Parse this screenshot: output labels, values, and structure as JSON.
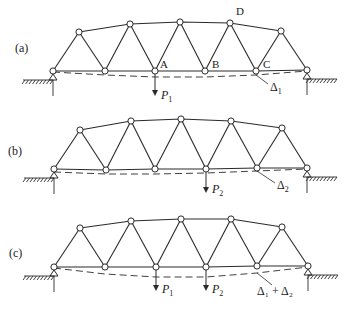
{
  "figure": {
    "panels": [
      {
        "id": "a",
        "label": "(a)",
        "label_pos": [
          15,
          52
        ],
        "bottom_nodes": [
          [
            53,
            71
          ],
          [
            105,
            71
          ],
          [
            155,
            71
          ],
          [
            205,
            71
          ],
          [
            256,
            71
          ],
          [
            307,
            70
          ]
        ],
        "top_nodes": [
          [
            79,
            32
          ],
          [
            130,
            24
          ],
          [
            180,
            22
          ],
          [
            230,
            23
          ],
          [
            281,
            31
          ]
        ],
        "node_labels": [
          {
            "text": "A",
            "x": 160,
            "y": 68
          },
          {
            "text": "B",
            "x": 212,
            "y": 68
          },
          {
            "text": "C",
            "x": 263,
            "y": 68
          },
          {
            "text": "D",
            "x": 236,
            "y": 15
          }
        ],
        "deflected_curve": [
          [
            53,
            72
          ],
          [
            105,
            75
          ],
          [
            155,
            77
          ],
          [
            205,
            77
          ],
          [
            256,
            75
          ],
          [
            307,
            71
          ]
        ],
        "loads": [
          {
            "node_x": 155,
            "node_y": 71,
            "tip_y": 96,
            "label": "P",
            "sub": "1",
            "lx": 161,
            "ly": 99
          }
        ],
        "deflection": {
          "from": [
            256,
            75
          ],
          "to": [
            268,
            84
          ],
          "label": "Δ",
          "sub": "1",
          "lx": 270,
          "ly": 91
        }
      },
      {
        "id": "b",
        "label": "(b)",
        "label_pos": [
          8,
          155
        ],
        "bottom_nodes": [
          [
            54,
            169
          ],
          [
            106,
            170
          ],
          [
            155,
            169
          ],
          [
            206,
            169
          ],
          [
            257,
            168
          ],
          [
            307,
            168
          ]
        ],
        "top_nodes": [
          [
            80,
            130
          ],
          [
            131,
            121
          ],
          [
            181,
            119
          ],
          [
            231,
            121
          ],
          [
            282,
            128
          ]
        ],
        "node_labels": [],
        "deflected_curve": [
          [
            54,
            172
          ],
          [
            106,
            174
          ],
          [
            155,
            174
          ],
          [
            206,
            173
          ],
          [
            257,
            171
          ],
          [
            307,
            169
          ]
        ],
        "loads": [
          {
            "node_x": 206,
            "node_y": 169,
            "tip_y": 193,
            "label": "P",
            "sub": "2",
            "lx": 212,
            "ly": 193
          }
        ],
        "deflection": {
          "from": [
            257,
            171
          ],
          "to": [
            275,
            183
          ],
          "label": "Δ",
          "sub": "2",
          "lx": 277,
          "ly": 189
        }
      },
      {
        "id": "c",
        "label": "(c)",
        "label_pos": [
          9,
          257
        ],
        "bottom_nodes": [
          [
            54,
            267
          ],
          [
            105,
            267
          ],
          [
            156,
            267
          ],
          [
            206,
            267
          ],
          [
            257,
            266
          ],
          [
            308,
            266
          ]
        ],
        "top_nodes": [
          [
            80,
            228
          ],
          [
            131,
            221
          ],
          [
            181,
            219
          ],
          [
            231,
            219
          ],
          [
            282,
            227
          ]
        ],
        "node_labels": [],
        "deflected_curve": [
          [
            54,
            268
          ],
          [
            105,
            274
          ],
          [
            156,
            277
          ],
          [
            206,
            277
          ],
          [
            257,
            273
          ],
          [
            308,
            267
          ]
        ],
        "loads": [
          {
            "node_x": 156,
            "node_y": 267,
            "tip_y": 291,
            "label": "P",
            "sub": "1",
            "lx": 162,
            "ly": 293
          },
          {
            "node_x": 206,
            "node_y": 267,
            "tip_y": 291,
            "label": "P",
            "sub": "2",
            "lx": 212,
            "ly": 293
          }
        ],
        "deflection": {
          "from": [
            257,
            273
          ],
          "to": [
            272,
            285
          ],
          "label": "Δ₁ + Δ₂",
          "sub": "",
          "lx": 257,
          "ly": 295
        }
      }
    ]
  }
}
